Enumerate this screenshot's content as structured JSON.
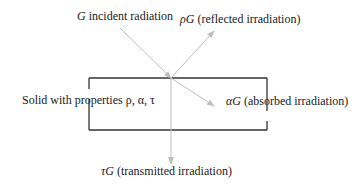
{
  "diagram": {
    "colors": {
      "box_stroke": "#333333",
      "arrow_stroke": "#bdbdbd",
      "text": "#1a1a1a"
    },
    "labels": {
      "incident": {
        "symbol": "G",
        "text": " incident radiation"
      },
      "reflected": {
        "symbol": "ρG",
        "text": " (reflected irradiation)"
      },
      "absorbed": {
        "symbol": "αG",
        "text": " (absorbed irradiation)"
      },
      "transmitted": {
        "symbol": "τG",
        "text": " (transmitted irradiation)"
      },
      "solid": {
        "text": "Solid with properties ρ, α, τ"
      }
    },
    "arrows": [
      {
        "name": "incident",
        "from": [
          120,
          28
        ],
        "to": [
          171,
          78
        ]
      },
      {
        "name": "reflected",
        "from": [
          171,
          78
        ],
        "to": [
          214,
          31
        ]
      },
      {
        "name": "absorbed",
        "from": [
          171,
          78
        ],
        "to": [
          214,
          106
        ]
      },
      {
        "name": "transmitted",
        "from": [
          171,
          78
        ],
        "to": [
          171,
          164
        ]
      }
    ]
  }
}
